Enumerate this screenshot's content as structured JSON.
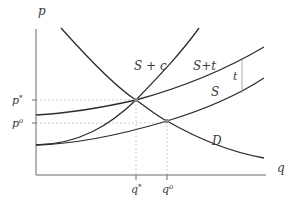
{
  "diagram": {
    "type": "supply-demand-tax-diagram",
    "axes": {
      "y_label": "p",
      "x_label": "q"
    },
    "y_ticks": [
      {
        "label": "p*",
        "sym": "p",
        "sup": "*"
      },
      {
        "label": "p°",
        "sym": "p",
        "sup": "o"
      }
    ],
    "x_ticks": [
      {
        "label": "q*",
        "sym": "q",
        "sup": "*"
      },
      {
        "label": "q°",
        "sym": "q",
        "sup": "o"
      }
    ],
    "curves": [
      {
        "id": "S+c",
        "label": "S + c"
      },
      {
        "id": "S+t",
        "label": "S+t"
      },
      {
        "id": "S",
        "label": "S"
      },
      {
        "id": "D",
        "label": "D"
      }
    ],
    "wedge_label": "t",
    "colors": {
      "curve": "#2e2e2e",
      "axis": "#6a6a6a",
      "guide": "#b8b8b8",
      "text": "#3a3a3a"
    }
  }
}
